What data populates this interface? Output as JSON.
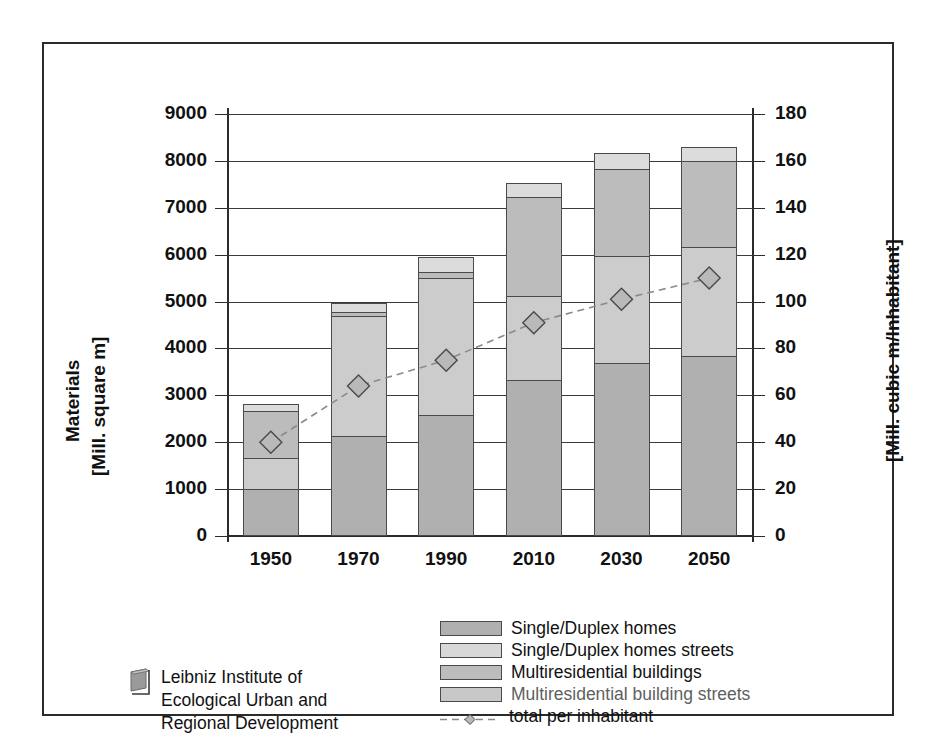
{
  "chart_data": {
    "type": "bar",
    "title": "",
    "xlabel": "",
    "categories": [
      "1950",
      "1970",
      "1990",
      "2010",
      "2030",
      "2050"
    ],
    "ylabel_left_line1": "Materials",
    "ylabel_left_line2": "[Mill. square m]",
    "ylabel_right": "[Mill. cubic m/Inhabitant]",
    "ylim_left": [
      0,
      9000
    ],
    "yticks_left": [
      "0",
      "1000",
      "2000",
      "3000",
      "4000",
      "5000",
      "6000",
      "7000",
      "8000",
      "9000"
    ],
    "ylim_right": [
      0,
      180
    ],
    "yticks_right": [
      "0",
      "20",
      "40",
      "60",
      "80",
      "100",
      "120",
      "140",
      "160",
      "180"
    ],
    "grid": true,
    "legend_position": "bottom",
    "stacked": true,
    "series": [
      {
        "name": "Single/Duplex homes",
        "axis": "left",
        "color": "#b0b0b0",
        "values": [
          1010,
          2130,
          2570,
          3330,
          3700,
          3840
        ]
      },
      {
        "name": "Single/Duplex homes streets",
        "axis": "left",
        "color": "#cccccc",
        "values": [
          660,
          2570,
          2930,
          1780,
          2270,
          2320
        ]
      },
      {
        "name": "Multiresidential buildings",
        "axis": "left",
        "color": "#bcbcbc",
        "values": [
          1000,
          80,
          120,
          2110,
          1850,
          1840
        ]
      },
      {
        "name": "Multiresidential building streets",
        "axis": "left",
        "color": "#dcdcdc",
        "values": [
          140,
          180,
          330,
          300,
          350,
          300
        ]
      },
      {
        "name": "total per inhabitant",
        "axis": "right",
        "type": "line",
        "marker": "diamond",
        "dash": "dashed",
        "color": "#8a8a8a",
        "values": [
          40,
          64,
          75,
          91,
          101,
          110
        ]
      }
    ],
    "totals_left": [
      2810,
      4960,
      5950,
      7520,
      8170,
      8300
    ]
  },
  "legend": {
    "items": [
      {
        "label": "Single/Duplex homes",
        "swatch": "#b0b0b0",
        "faded": false
      },
      {
        "label": "Single/Duplex homes streets",
        "swatch": "#d8d8d8",
        "faded": false
      },
      {
        "label": "Multiresidential buildings",
        "swatch": "#bcbcbc",
        "faded": false
      },
      {
        "label": "Multiresidential building streets",
        "swatch": "#c8c8c8",
        "faded": true
      },
      {
        "label": "total per inhabitant",
        "swatch": "",
        "faded": false
      }
    ]
  },
  "footer": {
    "logo": "book-logo-icon",
    "line1": "Leibniz Institute of",
    "line2": "Ecological Urban and",
    "line3": "Regional Development"
  },
  "colors": {
    "frame": "#2b2b2b",
    "grid": "#3a3a3a",
    "text": "#111111",
    "line": "#8a8a8a",
    "marker_fill": "#b9b9b9"
  }
}
